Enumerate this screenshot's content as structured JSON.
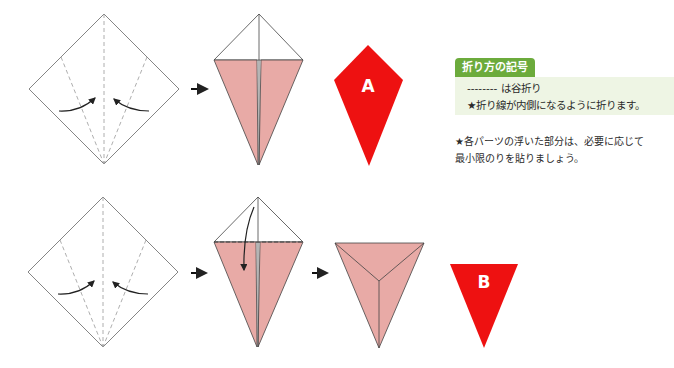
{
  "legend": {
    "title": "折り方の記号",
    "valley_fold_line": "-------- は谷折り",
    "valley_fold_note": "★折り線が内側になるように折ります。"
  },
  "note": {
    "line1": "★各パーツの浮いた部分は、必要に応じて",
    "line2": "最小限のりを貼りましょう。"
  },
  "parts": {
    "a": {
      "label": "A",
      "color": "#ee1111"
    },
    "b": {
      "label": "B",
      "color": "#ee1111"
    }
  },
  "colors": {
    "paper_back": "#e8aaa6",
    "paper_front": "#ffffff",
    "line": "#555555",
    "arrow": "#222222",
    "legend_green": "#6cab3c",
    "legend_bg": "#eef5e4"
  },
  "steps": {
    "row1": [
      "square-with-valley-folds",
      "kite-fold",
      "part-a"
    ],
    "row2": [
      "square-with-valley-folds",
      "kite-fold-top-down",
      "triangle",
      "part-b"
    ]
  }
}
